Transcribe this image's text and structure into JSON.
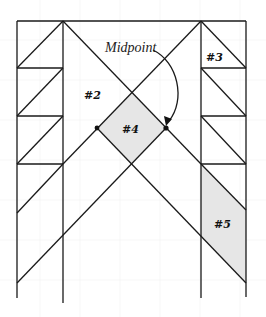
{
  "diagram": {
    "labels": {
      "midpoint": "Midpoint",
      "patch2": "#2",
      "patch3": "#3",
      "patch4": "#4",
      "patch5": "#5"
    },
    "colors": {
      "line": "#1a1a1a",
      "shade": "#e6e6e6",
      "background": "#ffffff"
    }
  }
}
